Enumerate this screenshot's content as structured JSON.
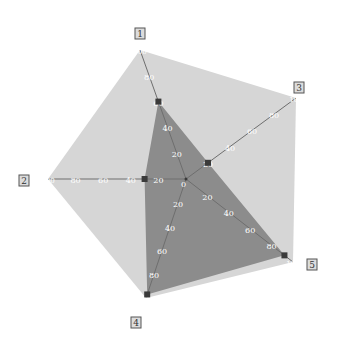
{
  "chart_data": {
    "type": "radar",
    "title": "",
    "axes": [
      "1",
      "2",
      "3",
      "4",
      "5"
    ],
    "axis_order_clockwise_from_top": [
      "1",
      "3",
      "5",
      "4",
      "2"
    ],
    "range": [
      0,
      100
    ],
    "ticks": [
      0,
      20,
      40,
      60,
      80,
      100
    ],
    "series": [
      {
        "name": "max",
        "values": {
          "1": 100,
          "2": 100,
          "3": 100,
          "4": 100,
          "5": 100
        },
        "color": "#d6d6d6"
      },
      {
        "name": "value",
        "values": {
          "1": 60,
          "2": 30,
          "3": 20,
          "4": 97,
          "5": 92
        },
        "color": "#8c8c8c",
        "marker": "square"
      }
    ],
    "grid": false,
    "legend": "none"
  },
  "colors": {
    "outer_fill": "#d6d6d6",
    "inner_fill": "#8c8c8c",
    "axis_line": "#6e6e6e",
    "marker": "#3a3a3a",
    "label_box": "#dcdcdc"
  },
  "labels": {
    "axis_1": "1",
    "axis_2": "2",
    "axis_3": "3",
    "axis_4": "4",
    "axis_5": "5",
    "center_tick": "0"
  }
}
